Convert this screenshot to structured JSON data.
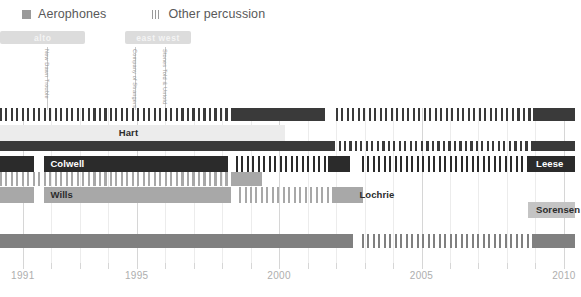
{
  "chart_data": {
    "type": "timeline",
    "title": "",
    "xlabel": "",
    "ylabel": "",
    "xlim": [
      1990.2,
      2010.6
    ],
    "grid": true,
    "legend_position": "top-left",
    "axis": {
      "ticks": [
        1991,
        1992,
        1993,
        1994,
        1995,
        1996,
        1997,
        1998,
        1999,
        2000,
        2001,
        2002,
        2003,
        2004,
        2005,
        2006,
        2007,
        2008,
        2009,
        2010
      ],
      "labeled_ticks": [
        {
          "year": 1991,
          "label": "1991"
        },
        {
          "year": 1995,
          "label": "1995"
        },
        {
          "year": 2000,
          "label": "2000"
        },
        {
          "year": 2005,
          "label": "2005"
        },
        {
          "year": 2010,
          "label": "2010"
        }
      ]
    },
    "legend": [
      {
        "label": "Aerophones",
        "color": "#9a9a9a",
        "pattern": "solid"
      },
      {
        "label": "Other percussion",
        "color": "#9a9a9a",
        "pattern": "hatched"
      }
    ],
    "eras": [
      {
        "label": "alto",
        "start": 1990.2,
        "end": 1993.2
      },
      {
        "label": "east west",
        "start": 1994.6,
        "end": 1996.9
      }
    ],
    "events": [
      {
        "caption": "New Dawn Trouble",
        "year": 1991.85
      },
      {
        "caption": "Company of Strangers",
        "year": 1994.95
      },
      {
        "caption": "Stones Told & Untold",
        "year": 1996.0
      }
    ],
    "lanes": [
      {
        "name": "lane-1-ticks",
        "label": "",
        "label_year": null,
        "label_on_dark": false,
        "segments": [
          {
            "start": 1990.2,
            "end": 1998.3,
            "color": "#3a3a3a",
            "pattern": "hatched"
          },
          {
            "start": 1998.3,
            "end": 2001.6,
            "color": "#3a3a3a",
            "pattern": "solid"
          },
          {
            "start": 2002.0,
            "end": 2008.9,
            "color": "#3a3a3a",
            "pattern": "hatched"
          },
          {
            "start": 2008.9,
            "end": 2010.4,
            "color": "#3a3a3a",
            "pattern": "solid"
          }
        ]
      },
      {
        "name": "lane-hart",
        "label": "Hart",
        "label_year": 1994.3,
        "label_on_dark": false,
        "segments": [
          {
            "start": 1990.2,
            "end": 1998.3,
            "color": "#ececec",
            "pattern": "solid"
          },
          {
            "start": 1998.3,
            "end": 2000.2,
            "color": "#ececec",
            "pattern": "solid"
          }
        ]
      },
      {
        "name": "lane-2-dark",
        "label": "",
        "label_year": null,
        "label_on_dark": false,
        "segments": [
          {
            "start": 1990.2,
            "end": 2001.9,
            "color": "#3a3a3a",
            "pattern": "solid"
          },
          {
            "start": 2001.9,
            "end": 2008.9,
            "color": "#3a3a3a",
            "pattern": "hatched"
          },
          {
            "start": 2008.9,
            "end": 2010.4,
            "color": "#3a3a3a",
            "pattern": "solid"
          }
        ]
      },
      {
        "name": "lane-colwell",
        "label": "Colwell",
        "label_year": 1991.9,
        "label_on_dark": true,
        "segments": [
          {
            "start": 1990.2,
            "end": 1991.4,
            "color": "#2b2b2b",
            "pattern": "solid"
          },
          {
            "start": 1991.75,
            "end": 1998.2,
            "color": "#2b2b2b",
            "pattern": "solid"
          },
          {
            "start": 1998.5,
            "end": 2001.7,
            "color": "#2b2b2b",
            "pattern": "hatched"
          },
          {
            "start": 2001.7,
            "end": 2002.5,
            "color": "#2b2b2b",
            "pattern": "solid"
          },
          {
            "start": 2002.9,
            "end": 2008.9,
            "color": "#2b2b2b",
            "pattern": "hatched"
          },
          {
            "start": 2008.9,
            "end": 2010.4,
            "color": "#2b2b2b",
            "pattern": "solid"
          }
        ]
      },
      {
        "name": "lane-leese",
        "label": "Leese",
        "label_year": 2008.95,
        "label_on_dark": true,
        "segments": [
          {
            "start": 2008.75,
            "end": 2010.4,
            "color": "#2b2b2b",
            "pattern": "solid"
          }
        ]
      },
      {
        "name": "lane-3-mid",
        "label": "",
        "label_year": null,
        "label_on_dark": false,
        "segments": [
          {
            "start": 1990.2,
            "end": 1998.3,
            "color": "#a8a8a8",
            "pattern": "hatched"
          },
          {
            "start": 1998.3,
            "end": 1999.4,
            "color": "#a8a8a8",
            "pattern": "solid"
          }
        ]
      },
      {
        "name": "lane-wills",
        "label": "Wills",
        "label_year": 1991.9,
        "label_on_dark": false,
        "segments": [
          {
            "start": 1990.2,
            "end": 1991.4,
            "color": "#a8a8a8",
            "pattern": "solid"
          },
          {
            "start": 1991.75,
            "end": 1998.3,
            "color": "#a8a8a8",
            "pattern": "solid"
          },
          {
            "start": 1998.6,
            "end": 2001.9,
            "color": "#a8a8a8",
            "pattern": "hatched"
          },
          {
            "start": 2001.9,
            "end": 2002.6,
            "color": "#a8a8a8",
            "pattern": "solid"
          }
        ]
      },
      {
        "name": "lane-lochrie",
        "label": "Lochrie",
        "label_year": 2002.75,
        "label_on_dark": false,
        "segments": [
          {
            "start": 2002.1,
            "end": 2002.95,
            "color": "#a8a8a8",
            "pattern": "solid"
          }
        ]
      },
      {
        "name": "lane-sorensen",
        "label": "Sorensen",
        "label_year": 2008.95,
        "label_on_dark": false,
        "segments": [
          {
            "start": 2008.75,
            "end": 2010.4,
            "color": "#c4c4c4",
            "pattern": "solid"
          }
        ]
      },
      {
        "name": "lane-bottom",
        "label": "",
        "label_year": null,
        "label_on_dark": false,
        "segments": [
          {
            "start": 1990.2,
            "end": 2002.6,
            "color": "#808080",
            "pattern": "solid"
          },
          {
            "start": 2002.9,
            "end": 2008.9,
            "color": "#808080",
            "pattern": "hatched"
          },
          {
            "start": 2008.9,
            "end": 2010.4,
            "color": "#808080",
            "pattern": "solid"
          }
        ]
      }
    ]
  }
}
